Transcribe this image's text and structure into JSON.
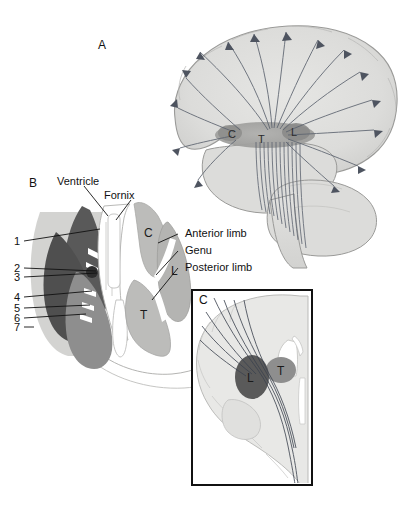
{
  "figure": {
    "background_color": "#ffffff"
  },
  "panels": [
    {
      "id": "A",
      "letter": "A",
      "description": "Lateral view of cerebral hemisphere showing corona radiata fibers radiating from the internal capsule",
      "structure_labels": [
        {
          "key": "C",
          "text": "C",
          "meaning": "Caudate nucleus"
        },
        {
          "key": "T",
          "text": "T",
          "meaning": "Thalamus"
        },
        {
          "key": "L",
          "text": "L",
          "meaning": "Lentiform nucleus"
        }
      ]
    },
    {
      "id": "B",
      "letter": "B",
      "description": "Horizontal (axial) section through the basal ganglia showing the internal capsule",
      "callout_labels": [
        {
          "text": "Ventricle"
        },
        {
          "text": "Fornix"
        },
        {
          "text": "Anterior limb"
        },
        {
          "text": "Genu"
        },
        {
          "text": "Posterior limb"
        }
      ],
      "numbered_labels": [
        "1",
        "2",
        "3",
        "4",
        "5",
        "6",
        "7"
      ],
      "structure_labels": [
        {
          "key": "C",
          "text": "C",
          "meaning": "Caudate nucleus"
        },
        {
          "key": "L",
          "text": "L",
          "meaning": "Lentiform nucleus"
        },
        {
          "key": "T",
          "text": "T",
          "meaning": "Thalamus"
        }
      ]
    },
    {
      "id": "C",
      "letter": "C",
      "description": "Coronal section of cerebral hemisphere showing descending fiber tracts between lentiform nucleus and thalamus",
      "structure_labels": [
        {
          "key": "L",
          "text": "L",
          "meaning": "Lentiform nucleus"
        },
        {
          "key": "T",
          "text": "T",
          "meaning": "Thalamus"
        }
      ]
    }
  ],
  "colors": {
    "brain_light": "#dcdcda",
    "brain_outline": "#9a9a98",
    "fiber": "#5d6470",
    "gray_dark": "#595959",
    "gray_mid": "#8e8e8e",
    "gray_light": "#b8b8b8",
    "gray_pale": "#cfcfcf",
    "white": "#ffffff",
    "text": "#111111",
    "panel_border": "#111111"
  }
}
